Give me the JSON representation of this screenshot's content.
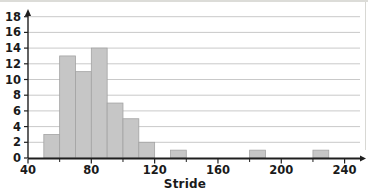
{
  "chart_data": {
    "type": "bar",
    "subtype": "histogram",
    "title": "",
    "xlabel": "Stride",
    "ylabel": "",
    "xlim": [
      40,
      248
    ],
    "ylim": [
      0,
      19
    ],
    "grid": "horizontal",
    "legend": "none",
    "bin_width": 10,
    "bins": [
      {
        "bin_start": 50,
        "bin_end": 60,
        "count": 3
      },
      {
        "bin_start": 60,
        "bin_end": 70,
        "count": 13
      },
      {
        "bin_start": 70,
        "bin_end": 80,
        "count": 11
      },
      {
        "bin_start": 80,
        "bin_end": 90,
        "count": 14
      },
      {
        "bin_start": 90,
        "bin_end": 100,
        "count": 7
      },
      {
        "bin_start": 100,
        "bin_end": 110,
        "count": 5
      },
      {
        "bin_start": 110,
        "bin_end": 120,
        "count": 2
      },
      {
        "bin_start": 130,
        "bin_end": 140,
        "count": 1
      },
      {
        "bin_start": 180,
        "bin_end": 190,
        "count": 1
      },
      {
        "bin_start": 220,
        "bin_end": 230,
        "count": 1
      }
    ],
    "x_ticks_major": [
      40,
      80,
      120,
      160,
      200,
      240
    ],
    "x_ticks_minor": [
      60,
      100,
      140,
      180,
      220
    ],
    "y_ticks": [
      0,
      2,
      4,
      6,
      8,
      10,
      12,
      14,
      16,
      18
    ],
    "colors": {
      "bar_fill": "#c6c6c6",
      "bar_stroke": "#a3a3a3",
      "grid": "#c9c9c9",
      "axis": "#1f1f1f",
      "text": "#1a1a1a"
    }
  }
}
